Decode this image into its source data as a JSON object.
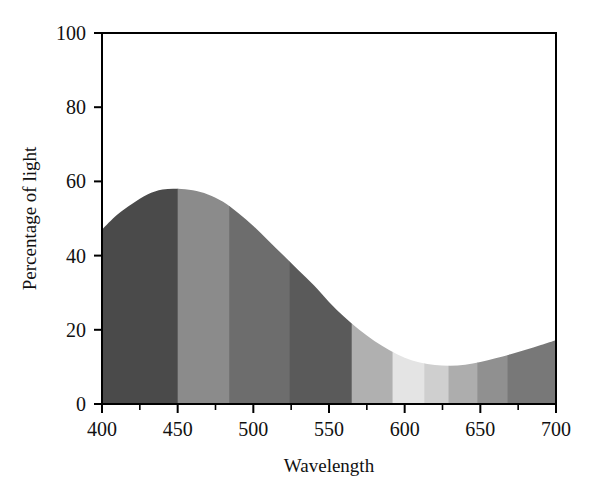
{
  "chart_data": {
    "type": "area",
    "title": "",
    "xlabel": "Wavelength",
    "ylabel": "Percentage of light",
    "xlim": [
      400,
      700
    ],
    "ylim": [
      0,
      100
    ],
    "grid": false,
    "legend": "none",
    "x_ticks": [
      400,
      450,
      500,
      550,
      600,
      650,
      700
    ],
    "x_minor_ticks": [
      425,
      475,
      525,
      575,
      625,
      675
    ],
    "y_ticks": [
      0,
      20,
      40,
      60,
      80,
      100
    ],
    "x_tick_labels": [
      "400",
      "450",
      "500",
      "550",
      "600",
      "650",
      "700"
    ],
    "y_tick_labels": [
      "0",
      "20",
      "40",
      "60",
      "80",
      "100"
    ],
    "series": [
      {
        "name": "Percentage of light",
        "x": [
          400,
          410,
          420,
          430,
          440,
          450,
          460,
          470,
          480,
          490,
          500,
          510,
          520,
          530,
          540,
          550,
          560,
          570,
          580,
          590,
          600,
          610,
          620,
          630,
          640,
          650,
          660,
          670,
          680,
          690,
          700
        ],
        "values": [
          47,
          51,
          54,
          56.5,
          57.8,
          58,
          57.6,
          56.5,
          54.5,
          51.5,
          48,
          44,
          40,
          36,
          32,
          27.5,
          23.5,
          20,
          17,
          14.5,
          12.5,
          11.2,
          10.5,
          10.3,
          10.6,
          11.3,
          12.3,
          13.4,
          14.6,
          15.9,
          17.2
        ]
      }
    ],
    "fill_bands": [
      {
        "x_start": 400,
        "x_end": 450,
        "color": "#4a4a4a"
      },
      {
        "x_start": 450,
        "x_end": 484,
        "color": "#8b8b8b"
      },
      {
        "x_start": 484,
        "x_end": 524,
        "color": "#6d6d6d"
      },
      {
        "x_start": 524,
        "x_end": 565,
        "color": "#5a5a5a"
      },
      {
        "x_start": 565,
        "x_end": 592,
        "color": "#b0b0b0"
      },
      {
        "x_start": 592,
        "x_end": 613,
        "color": "#e4e4e4"
      },
      {
        "x_start": 613,
        "x_end": 629,
        "color": "#cfcfcf"
      },
      {
        "x_start": 629,
        "x_end": 648,
        "color": "#adadad"
      },
      {
        "x_start": 648,
        "x_end": 668,
        "color": "#909090"
      },
      {
        "x_start": 668,
        "x_end": 700,
        "color": "#787878"
      }
    ]
  },
  "figure": {
    "axis_color": "#000000",
    "background": "#ffffff",
    "plot_border": "solid"
  }
}
